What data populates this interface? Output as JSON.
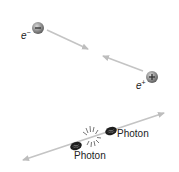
{
  "diagram": {
    "title": "",
    "particles": {
      "electron": {
        "symbol": "e",
        "charge_sign": "−",
        "label_sup": "−",
        "icon": "minus-sign"
      },
      "positron": {
        "symbol": "e",
        "charge_sign": "+",
        "label_sup": "+",
        "icon": "plus-sign"
      }
    },
    "photons": [
      {
        "label": "Photon",
        "position": "left"
      },
      {
        "label": "Photon",
        "position": "right"
      }
    ],
    "colors": {
      "arrow": "#c4c4c4",
      "particle_fill": "#8a8a8a",
      "photon_fill": "#1e1e1e",
      "text": "#222222"
    }
  }
}
